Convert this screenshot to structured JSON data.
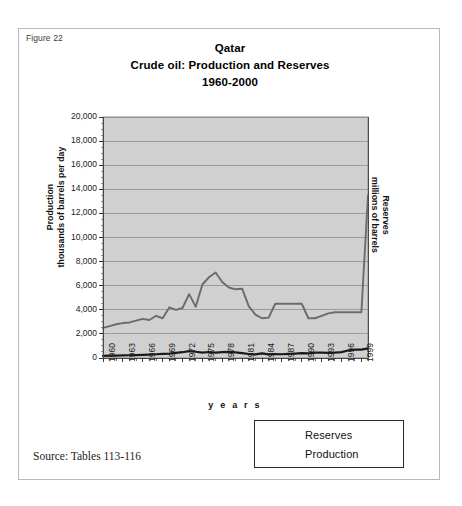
{
  "figure": {
    "label": "Figure 22",
    "source": "Source: Tables 113-116"
  },
  "colors": {
    "plot_background": "#d0d0d0",
    "plot_border": "#8a8a8a",
    "gridline": "#8e8e8e",
    "reserves_line": "#6b6b6b",
    "production_line": "#1a1a1a",
    "frame": "#b9b9b9",
    "text": "#111111"
  },
  "legend": {
    "position": "bottom-right",
    "entries": [
      {
        "label": "Reserves",
        "color": "#6b6b6b",
        "width": 2
      },
      {
        "label": "Production",
        "color": "#1a1a1a",
        "width": 3
      }
    ]
  },
  "chart_data": {
    "type": "line",
    "title": "Qatar",
    "title_lines": [
      "Qatar",
      "Crude oil: Production and Reserves",
      "1960-2000"
    ],
    "subtitle": "Crude oil: Production and Reserves",
    "period": "1960-2000",
    "xlabel": "y e a r s",
    "ylabel": "Production\nthousands of barrels per day",
    "ylabel_lines": [
      "Production",
      "thousands of barrels per day"
    ],
    "ylabel_right": "Reserves\nmillions of barrels",
    "ylabel_right_lines": [
      "Reserves",
      "millions of barrels"
    ],
    "ylim": [
      0,
      20000
    ],
    "ytick_step": 2000,
    "yticks": [
      0,
      2000,
      4000,
      6000,
      8000,
      10000,
      12000,
      14000,
      16000,
      18000,
      20000
    ],
    "ytick_labels": [
      "0",
      "2,000",
      "4,000",
      "6,000",
      "8,000",
      "10,000",
      "12,000",
      "14,000",
      "16,000",
      "18,000",
      "20,000"
    ],
    "grid": true,
    "xlim": [
      1960,
      2000
    ],
    "xtick_labels": [
      "1960",
      "1963",
      "1966",
      "1969",
      "1972",
      "1975",
      "1978",
      "1981",
      "1984",
      "1987",
      "1990",
      "1993",
      "1996",
      "1999"
    ],
    "xticks": [
      1960,
      1963,
      1966,
      1969,
      1972,
      1975,
      1978,
      1981,
      1984,
      1987,
      1990,
      1993,
      1996,
      1999
    ],
    "x": [
      1960,
      1961,
      1962,
      1963,
      1964,
      1965,
      1966,
      1967,
      1968,
      1969,
      1970,
      1971,
      1972,
      1973,
      1974,
      1975,
      1976,
      1977,
      1978,
      1979,
      1980,
      1981,
      1982,
      1983,
      1984,
      1985,
      1986,
      1987,
      1988,
      1989,
      1990,
      1991,
      1992,
      1993,
      1994,
      1995,
      1996,
      1997,
      1998,
      1999,
      2000
    ],
    "series": [
      {
        "name": "Reserves",
        "unit": "millions of barrels",
        "color": "#6b6b6b",
        "values": [
          2500,
          2650,
          2800,
          2900,
          2950,
          3100,
          3250,
          3150,
          3500,
          3300,
          4200,
          4000,
          4150,
          5300,
          4250,
          6100,
          6700,
          7100,
          6300,
          5850,
          5700,
          5750,
          4300,
          3600,
          3300,
          3350,
          4500,
          4500,
          4500,
          4500,
          4500,
          3300,
          3300,
          3500,
          3700,
          3800,
          3800,
          3800,
          3800,
          3800,
          13500
        ]
      },
      {
        "name": "Production",
        "unit": "thousands of barrels per day",
        "color": "#1a1a1a",
        "values": [
          175,
          190,
          200,
          210,
          230,
          240,
          260,
          280,
          310,
          350,
          370,
          430,
          480,
          570,
          520,
          440,
          500,
          440,
          480,
          510,
          470,
          400,
          330,
          300,
          390,
          300,
          330,
          310,
          340,
          370,
          400,
          390,
          450,
          440,
          430,
          440,
          490,
          620,
          700,
          690,
          800
        ]
      }
    ]
  }
}
